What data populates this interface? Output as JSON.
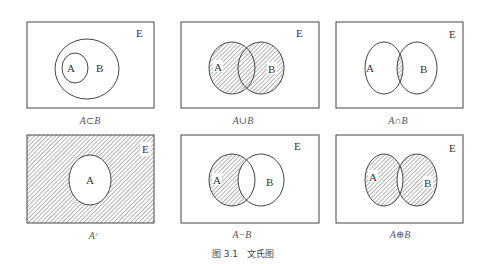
{
  "figure": {
    "title": "图 3.1　文氏图",
    "universe_label": "E",
    "set_a_label": "A",
    "set_b_label": "B",
    "panels": [
      {
        "id": "subset",
        "caption": "A⊂B",
        "shaded": "none"
      },
      {
        "id": "union",
        "caption": "A∪B",
        "shaded": "A or B"
      },
      {
        "id": "intersection",
        "caption": "A∩B",
        "shaded": "A and B"
      },
      {
        "id": "complement",
        "caption": "Aᶜ",
        "shaded": "E minus A"
      },
      {
        "id": "difference",
        "caption": "A−B",
        "shaded": "A minus B"
      },
      {
        "id": "symmetric-difference",
        "caption": "A⊕B",
        "shaded": "A xor B"
      }
    ]
  },
  "colors": {
    "stroke": "#444444",
    "hatch": "#555555",
    "background": "#ffffff"
  }
}
